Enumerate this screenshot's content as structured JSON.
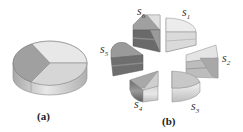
{
  "figure": {
    "panel_a": {
      "caption": "(a)",
      "description": "3D cylinder pie divided into 3 sectors"
    },
    "panel_b": {
      "caption": "(b)",
      "description": "Exploded pie with 6 slices",
      "slices": [
        {
          "label": "s",
          "sub": "1"
        },
        {
          "label": "s",
          "sub": "2"
        },
        {
          "label": "s",
          "sub": "3"
        },
        {
          "label": "s",
          "sub": "4"
        },
        {
          "label": "s",
          "sub": "5"
        },
        {
          "label": "s",
          "sub": "6"
        }
      ]
    },
    "colors": {
      "light": "#e6e6e6",
      "mid": "#bdbdbd",
      "dark": "#8a8a8a",
      "darker": "#6a6a6a",
      "edge": "#7a7a7a"
    }
  }
}
